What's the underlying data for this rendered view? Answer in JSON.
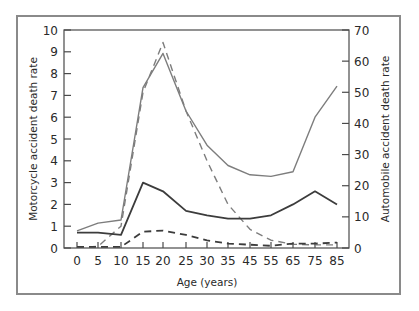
{
  "chart_data": {
    "type": "line",
    "title": "",
    "xlabel": "Age (years)",
    "ylabel_left": "Motorcycle accident death rate",
    "ylabel_right": "Automobile accident death rate",
    "x": [
      "0",
      "5",
      "10",
      "15",
      "20",
      "25",
      "30",
      "35",
      "45",
      "55",
      "65",
      "75",
      "85"
    ],
    "ylim_left": [
      0,
      10
    ],
    "ylim_right": [
      0,
      70
    ],
    "left_ticks": [
      "0",
      "1",
      "2",
      "3",
      "4",
      "5",
      "6",
      "7",
      "8",
      "9",
      "10"
    ],
    "right_ticks": [
      "0",
      "10",
      "20",
      "30",
      "40",
      "50",
      "60",
      "70"
    ],
    "grid": false,
    "legend": "none",
    "series": [
      {
        "name": "Automobile (solid, gray)",
        "axis": "right",
        "style": "solid",
        "color": "#7d7d7d",
        "values": [
          5.5,
          8.0,
          9.0,
          51.5,
          62.5,
          44.0,
          33.0,
          26.5,
          23.5,
          23.0,
          24.5,
          42.0,
          52.0
        ]
      },
      {
        "name": "Automobile (dashed, gray)",
        "axis": "right",
        "style": "dashed",
        "color": "#7d7d7d",
        "values": [
          0.2,
          0.5,
          7.0,
          50.0,
          66.0,
          44.0,
          28.0,
          14.0,
          6.0,
          2.5,
          1.2,
          1.0,
          1.0
        ]
      },
      {
        "name": "Motorcycle (solid, dark)",
        "axis": "left",
        "style": "solid",
        "color": "#3c3c3c",
        "values": [
          0.7,
          0.7,
          0.6,
          3.0,
          2.6,
          1.7,
          1.5,
          1.35,
          1.35,
          1.5,
          2.0,
          2.6,
          2.0
        ]
      },
      {
        "name": "Motorcycle (dashed, dark)",
        "axis": "left",
        "style": "dashed",
        "color": "#3c3c3c",
        "values": [
          0.05,
          0.05,
          0.05,
          0.75,
          0.8,
          0.6,
          0.35,
          0.2,
          0.15,
          0.1,
          0.2,
          0.2,
          0.25
        ]
      }
    ]
  }
}
